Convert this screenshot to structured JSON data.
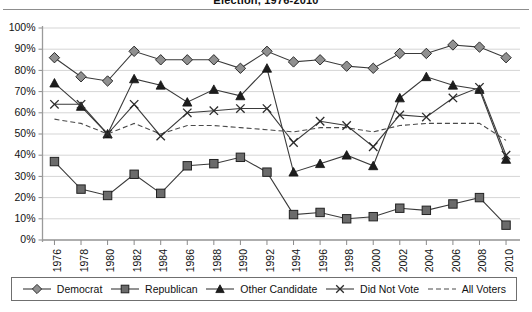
{
  "chart_data": {
    "type": "line",
    "title": "Election, 1976-2010",
    "xlabel": "",
    "ylabel": "",
    "ylim": [
      0,
      100
    ],
    "y_unit": "%",
    "grid": true,
    "legend_position": "bottom",
    "categories": [
      "1976",
      "1978",
      "1980",
      "1982",
      "1984",
      "1986",
      "1988",
      "1990",
      "1992",
      "1994",
      "1996",
      "1998",
      "2000",
      "2002",
      "2004",
      "2006",
      "2008",
      "2010"
    ],
    "yticks": [
      "0%",
      "10%",
      "20%",
      "30%",
      "40%",
      "50%",
      "60%",
      "70%",
      "80%",
      "90%",
      "100%"
    ],
    "ytick_values": [
      0,
      10,
      20,
      30,
      40,
      50,
      60,
      70,
      80,
      90,
      100
    ],
    "series": [
      {
        "name": "Democrat",
        "marker": "diamond",
        "style": "solid",
        "values": [
          86,
          77,
          75,
          89,
          85,
          85,
          85,
          81,
          89,
          84,
          85,
          82,
          81,
          88,
          88,
          92,
          91,
          86
        ]
      },
      {
        "name": "Republican",
        "marker": "square",
        "style": "solid",
        "values": [
          37,
          24,
          21,
          31,
          22,
          35,
          36,
          39,
          32,
          12,
          13,
          10,
          11,
          15,
          14,
          17,
          20,
          7
        ]
      },
      {
        "name": "Other Candidate",
        "marker": "triangle",
        "style": "solid",
        "values": [
          74,
          63,
          50,
          76,
          73,
          65,
          71,
          68,
          81,
          32,
          36,
          40,
          35,
          67,
          77,
          73,
          71,
          38
        ]
      },
      {
        "name": "Did Not Vote",
        "marker": "x",
        "style": "solid",
        "values": [
          64,
          64,
          50,
          64,
          49,
          60,
          61,
          62,
          62,
          46,
          56,
          54,
          44,
          59,
          58,
          67,
          72,
          40
        ]
      },
      {
        "name": "All Voters",
        "marker": "none",
        "style": "dashed",
        "values": [
          57,
          55,
          50,
          55,
          50,
          54,
          54,
          53,
          52,
          51,
          53,
          53,
          51,
          54,
          55,
          55,
          55,
          47
        ]
      }
    ]
  },
  "legend": {
    "items": [
      {
        "label": "Democrat",
        "icon": "diamond-marker-icon"
      },
      {
        "label": "Republican",
        "icon": "square-marker-icon"
      },
      {
        "label": "Other Candidate",
        "icon": "triangle-marker-icon"
      },
      {
        "label": "Did Not Vote",
        "icon": "x-marker-icon"
      },
      {
        "label": "All Voters",
        "icon": "dashed-line-icon"
      }
    ]
  }
}
